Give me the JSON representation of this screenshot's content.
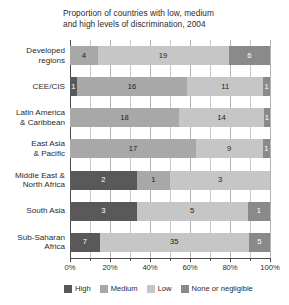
{
  "chart_data": {
    "type": "bar",
    "title": "Proportion of countries with low, medium and high levels of discrimination, 2004",
    "title_line1": "Proportion of countries with low, medium",
    "title_line2": "and high levels of discrimination, 2004",
    "orientation": "horizontal",
    "stacked": true,
    "normalized": true,
    "xlabel": "",
    "ylabel": "",
    "xlim": [
      0,
      100
    ],
    "xtick_labels": [
      "0%",
      "20%",
      "40%",
      "60%",
      "80%",
      "100%"
    ],
    "xtick_values": [
      0,
      20,
      40,
      60,
      80,
      100
    ],
    "xminor_values": [
      10,
      30,
      50,
      70,
      90
    ],
    "grid": true,
    "legend_position": "bottom-left",
    "categories": [
      "Developed regions",
      "CEE/CIS",
      "Latin America & Caribbean",
      "East Asia & Pacific",
      "Middle East & North Africa",
      "South Asia",
      "Sub-Saharan Africa"
    ],
    "category_lines": [
      [
        "Developed",
        "regions"
      ],
      [
        "CEE/CIS"
      ],
      [
        "Latin America",
        "& Caribbean"
      ],
      [
        "East Asia",
        "& Pacific"
      ],
      [
        "Middle East &",
        "North Africa"
      ],
      [
        "South Asia"
      ],
      [
        "Sub-Saharan",
        "Africa"
      ]
    ],
    "series": [
      {
        "name": "High",
        "color": "#595959",
        "values": [
          0,
          1,
          0,
          0,
          2,
          3,
          7
        ]
      },
      {
        "name": "Medium",
        "color": "#a8a8a8",
        "values": [
          4,
          16,
          18,
          17,
          1,
          0,
          0
        ]
      },
      {
        "name": "Low",
        "color": "#c6c6c6",
        "values": [
          19,
          11,
          14,
          9,
          3,
          5,
          35
        ]
      },
      {
        "name": "None or negligible",
        "color": "#8a8a8a",
        "values": [
          6,
          1,
          1,
          1,
          0,
          1,
          5
        ]
      }
    ],
    "row_totals": [
      29,
      29,
      33,
      27,
      6,
      9,
      47
    ],
    "legend": [
      {
        "label": "High",
        "color": "#595959"
      },
      {
        "label": "Medium",
        "color": "#a8a8a8"
      },
      {
        "label": "Low",
        "color": "#c6c6c6"
      },
      {
        "label": "None or negligible",
        "color": "#8a8a8a"
      }
    ],
    "rows": [
      {
        "category": "Developed regions",
        "segments": [
          {
            "series": "Medium",
            "value": 4,
            "label": "4",
            "pct": 13.79
          },
          {
            "series": "Low",
            "value": 19,
            "label": "19",
            "pct": 65.52
          },
          {
            "series": "None or negligible",
            "value": 6,
            "label": "6",
            "pct": 20.69
          }
        ]
      },
      {
        "category": "CEE/CIS",
        "segments": [
          {
            "series": "High",
            "value": 1,
            "label": "1",
            "pct": 3.45
          },
          {
            "series": "Medium",
            "value": 16,
            "label": "16",
            "pct": 55.17
          },
          {
            "series": "Low",
            "value": 11,
            "label": "11",
            "pct": 37.93
          },
          {
            "series": "None or negligible",
            "value": 1,
            "label": "1",
            "pct": 3.45
          }
        ]
      },
      {
        "category": "Latin America & Caribbean",
        "segments": [
          {
            "series": "Medium",
            "value": 18,
            "label": "18",
            "pct": 54.55
          },
          {
            "series": "Low",
            "value": 14,
            "label": "14",
            "pct": 42.42
          },
          {
            "series": "None or negligible",
            "value": 1,
            "label": "1",
            "pct": 3.03
          }
        ]
      },
      {
        "category": "East Asia & Pacific",
        "segments": [
          {
            "series": "Medium",
            "value": 17,
            "label": "17",
            "pct": 62.96
          },
          {
            "series": "Low",
            "value": 9,
            "label": "9",
            "pct": 33.33
          },
          {
            "series": "None or negligible",
            "value": 1,
            "label": "1",
            "pct": 3.7
          }
        ]
      },
      {
        "category": "Middle East & North Africa",
        "segments": [
          {
            "series": "High",
            "value": 2,
            "label": "2",
            "pct": 33.33
          },
          {
            "series": "Medium",
            "value": 1,
            "label": "1",
            "pct": 16.67
          },
          {
            "series": "Low",
            "value": 3,
            "label": "3",
            "pct": 50.0
          }
        ]
      },
      {
        "category": "South Asia",
        "segments": [
          {
            "series": "High",
            "value": 3,
            "label": "3",
            "pct": 33.33
          },
          {
            "series": "Low",
            "value": 5,
            "label": "5",
            "pct": 55.56
          },
          {
            "series": "None or negligible",
            "value": 1,
            "label": "1",
            "pct": 11.11
          }
        ]
      },
      {
        "category": "Sub-Saharan Africa",
        "segments": [
          {
            "series": "High",
            "value": 7,
            "label": "7",
            "pct": 14.89
          },
          {
            "series": "Low",
            "value": 35,
            "label": "35",
            "pct": 74.47
          },
          {
            "series": "None or negligible",
            "value": 5,
            "label": "5",
            "pct": 10.64
          }
        ]
      }
    ]
  }
}
